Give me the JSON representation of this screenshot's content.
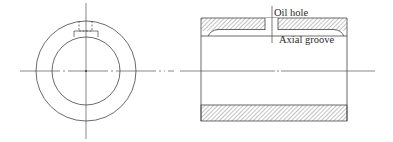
{
  "diagram": {
    "title": "",
    "type": "engineering drawing — plain journal bearing bush",
    "views": [
      {
        "name": "end-view",
        "description": "End view: two concentric circles with centerlines and hidden-line oil hole/groove at top"
      },
      {
        "name": "sectional-view",
        "description": "Longitudinal section of bush with hatched walls, oil hole through top wall and axial groove"
      }
    ],
    "labels": {
      "oil_hole": "Oil hole",
      "axial_groove": "Axial groove"
    },
    "colors": {
      "line": "#444444",
      "hatch": "#6a6a6a",
      "background": "#ffffff"
    }
  }
}
